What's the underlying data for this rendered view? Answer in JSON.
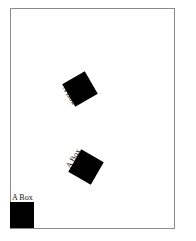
{
  "canvas": {
    "boxes": [
      {
        "label": "A Box",
        "rotation_deg": -30
      },
      {
        "label": "A Box",
        "rotation_deg": 30
      },
      {
        "label": "A Box",
        "rotation_deg": 0
      }
    ]
  }
}
